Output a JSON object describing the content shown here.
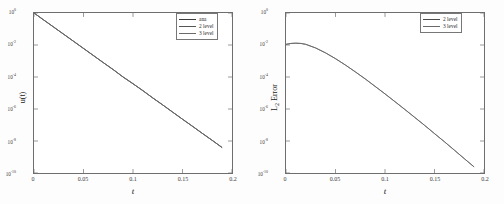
{
  "figure": {
    "background": "#fdfdfd",
    "axis_color": "#6e6e6e",
    "curve_color": "#4a4a4a"
  },
  "chart_data": [
    {
      "type": "line",
      "panel": "left",
      "title": "",
      "xlabel": "t",
      "ylabel": "u(t)",
      "yscale": "log",
      "xscale": "linear",
      "xlim": [
        0,
        0.2
      ],
      "ylim": [
        1e-10,
        1
      ],
      "grid": false,
      "legend_position": "upper right",
      "xticks": [
        0,
        0.05,
        0.1,
        0.15,
        0.2
      ],
      "xticklabels": [
        "0",
        "0.05",
        "0.1",
        "0.15",
        "0.2"
      ],
      "yticks": [
        1,
        0.01,
        0.0001,
        1e-06,
        1e-08,
        1e-10
      ],
      "yticklabels": [
        "10^0",
        "10^-2",
        "10^-4",
        "10^-6",
        "10^-8",
        "10^-10"
      ],
      "series": [
        {
          "name": "ana",
          "color": "#3c3c3c",
          "x": [
            0,
            0.01,
            0.02,
            0.03,
            0.04,
            0.05,
            0.06,
            0.07,
            0.08,
            0.09,
            0.1,
            0.11,
            0.12,
            0.13,
            0.14,
            0.15,
            0.16,
            0.17,
            0.18,
            0.19
          ],
          "y": [
            1.0,
            0.36,
            0.13,
            0.047,
            0.017,
            0.0061,
            0.0022,
            0.00079,
            0.00029,
            0.0001,
            3.8e-05,
            1.4e-05,
            4.9e-06,
            1.8e-06,
            6.4e-07,
            2.3e-07,
            8.4e-08,
            3e-08,
            1.1e-08,
            3.9e-09
          ]
        },
        {
          "name": "2 level",
          "color": "#555555",
          "x": [
            0,
            0.01,
            0.02,
            0.03,
            0.04,
            0.05,
            0.06,
            0.07,
            0.08,
            0.09,
            0.1,
            0.11,
            0.12,
            0.13,
            0.14,
            0.15,
            0.16,
            0.17,
            0.18,
            0.19
          ],
          "y": [
            1.0,
            0.36,
            0.13,
            0.047,
            0.017,
            0.0061,
            0.0022,
            0.00079,
            0.00029,
            0.0001,
            3.8e-05,
            1.4e-05,
            4.9e-06,
            1.8e-06,
            6.4e-07,
            2.3e-07,
            8.4e-08,
            3e-08,
            1.1e-08,
            3.9e-09
          ]
        },
        {
          "name": "3 level",
          "color": "#6a6a6a",
          "x": [
            0,
            0.01,
            0.02,
            0.03,
            0.04,
            0.05,
            0.06,
            0.07,
            0.08,
            0.09,
            0.1,
            0.11,
            0.12,
            0.13,
            0.14,
            0.15,
            0.16,
            0.17,
            0.18,
            0.19
          ],
          "y": [
            1.0,
            0.36,
            0.13,
            0.047,
            0.017,
            0.0061,
            0.0022,
            0.00079,
            0.00029,
            0.0001,
            3.8e-05,
            1.4e-05,
            4.9e-06,
            1.8e-06,
            6.4e-07,
            2.3e-07,
            8.4e-08,
            3e-08,
            1.1e-08,
            3.9e-09
          ]
        }
      ]
    },
    {
      "type": "line",
      "panel": "right",
      "title": "",
      "xlabel": "t",
      "ylabel": "L_2 Error",
      "yscale": "log",
      "xscale": "linear",
      "xlim": [
        0,
        0.2
      ],
      "ylim": [
        1e-10,
        1
      ],
      "grid": false,
      "legend_position": "upper right",
      "xticks": [
        0,
        0.05,
        0.1,
        0.15,
        0.2
      ],
      "xticklabels": [
        "0",
        "0.05",
        "0.1",
        "0.15",
        "0.2"
      ],
      "yticks": [
        1,
        0.01,
        0.0001,
        1e-06,
        1e-08,
        1e-10
      ],
      "yticklabels": [
        "10^0",
        "10^-2",
        "10^-4",
        "10^-6",
        "10^-8",
        "10^-10"
      ],
      "series": [
        {
          "name": "2 level",
          "color": "#4a4a4a",
          "x": [
            0,
            0.005,
            0.01,
            0.015,
            0.02,
            0.03,
            0.04,
            0.05,
            0.06,
            0.07,
            0.08,
            0.09,
            0.1,
            0.11,
            0.12,
            0.13,
            0.14,
            0.15,
            0.16,
            0.17,
            0.18,
            0.19
          ],
          "y": [
            0.011,
            0.0125,
            0.013,
            0.0125,
            0.011,
            0.0065,
            0.0032,
            0.0014,
            0.00056,
            0.00021,
            7.6e-05,
            2.6e-05,
            8.8e-06,
            2.9e-06,
            9.4e-07,
            3e-07,
            9.5e-08,
            2.9e-08,
            9e-09,
            2.7e-09,
            8e-10,
            2.4e-10
          ]
        },
        {
          "name": "3 level",
          "color": "#6a6a6a",
          "x": [
            0,
            0.005,
            0.01,
            0.015,
            0.02,
            0.03,
            0.04,
            0.05,
            0.06,
            0.07,
            0.08,
            0.09,
            0.1,
            0.11,
            0.12,
            0.13,
            0.14,
            0.15,
            0.16,
            0.17,
            0.18,
            0.19
          ],
          "y": [
            0.011,
            0.0125,
            0.013,
            0.0125,
            0.011,
            0.0065,
            0.0032,
            0.0014,
            0.00056,
            0.00021,
            7.6e-05,
            2.6e-05,
            8.8e-06,
            2.9e-06,
            9.4e-07,
            3e-07,
            9.5e-08,
            2.9e-08,
            9e-09,
            2.7e-09,
            8e-10,
            2.4e-10
          ]
        }
      ]
    }
  ],
  "left_panel": {
    "ylabel": "u(t)",
    "xlabel": "t",
    "yticklabels": [
      {
        "mantissa": "10",
        "exponent": "0"
      },
      {
        "mantissa": "10",
        "exponent": "-2"
      },
      {
        "mantissa": "10",
        "exponent": "-4"
      },
      {
        "mantissa": "10",
        "exponent": "-6"
      },
      {
        "mantissa": "10",
        "exponent": "-8"
      },
      {
        "mantissa": "10",
        "exponent": "-10"
      }
    ],
    "xticklabels": [
      "0",
      "0.05",
      "0.1",
      "0.15",
      "0.2"
    ],
    "legend": [
      {
        "label": "ana"
      },
      {
        "label": "2 level"
      },
      {
        "label": "3 level"
      }
    ]
  },
  "right_panel": {
    "ylabel_main": "L",
    "ylabel_sub": "2",
    "ylabel_tail": " Error",
    "xlabel": "t",
    "yticklabels": [
      {
        "mantissa": "10",
        "exponent": "0"
      },
      {
        "mantissa": "10",
        "exponent": "-2"
      },
      {
        "mantissa": "10",
        "exponent": "-4"
      },
      {
        "mantissa": "10",
        "exponent": "-6"
      },
      {
        "mantissa": "10",
        "exponent": "-8"
      },
      {
        "mantissa": "10",
        "exponent": "-10"
      }
    ],
    "xticklabels": [
      "0",
      "0.05",
      "0.1",
      "0.15",
      "0.2"
    ],
    "legend": [
      {
        "label": "2 level"
      },
      {
        "label": "3 level"
      }
    ]
  }
}
